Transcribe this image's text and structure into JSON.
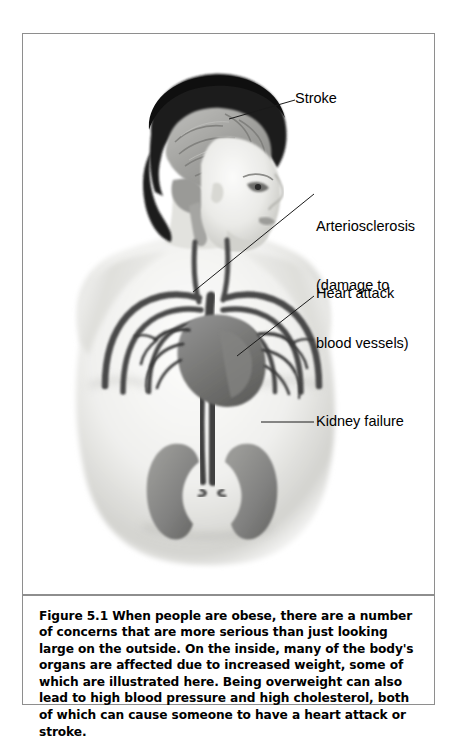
{
  "figure": {
    "caption_label": "Figure 5.1",
    "caption_body": " When people are obese, there are a number of concerns that are more serious than just looking large on the outside. On the inside, many of the body's organs are affected due to increased weight, some of which are illustrated here. Being overweight can also lead to high blood pressure and high cholesterol, both of which can cause someone to have a heart attack or stroke."
  },
  "callouts": {
    "stroke": "Stroke",
    "arteriosclerosis_line1": "Arteriosclerosis",
    "arteriosclerosis_line2": "(damage to",
    "arteriosclerosis_line3": "blood vessels)",
    "heart_attack": "Heart attack",
    "kidney_failure": "Kidney failure"
  },
  "illustration": {
    "description": "Grayscale medical illustration of an obese person shown from the chest up in three-quarter view, with internal organs visible: brain inside the head, heart and major blood vessels in the chest, aorta running down the abdomen, and two kidneys.",
    "parts": [
      "brain",
      "head-hair",
      "face-profile",
      "neck",
      "shoulders",
      "torso",
      "rib-vessels",
      "heart",
      "coronary-vessels",
      "aorta",
      "kidney-left",
      "kidney-right"
    ]
  },
  "colors": {
    "frame_border": "#8e8e8e",
    "text": "#000000",
    "skin_light": "#ededea",
    "skin_shadow": "#bdbdb8",
    "hair_dark": "#1e1e1e",
    "brain_gray": "#a9a9a6",
    "vessel_dark": "#4a4a4a",
    "organ_gray": "#8a8a88",
    "background": "#ffffff"
  }
}
